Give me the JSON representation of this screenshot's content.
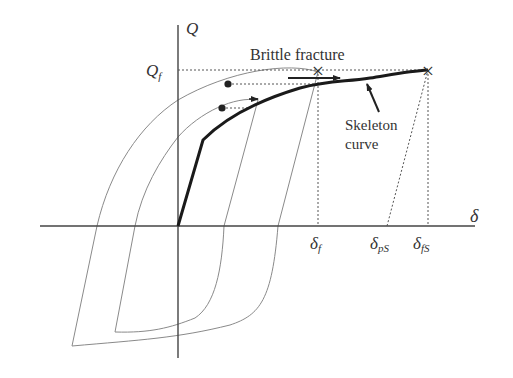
{
  "diagram": {
    "axes": {
      "y_label": "Q",
      "x_label": "δ"
    },
    "labels": {
      "q_f": "Q",
      "q_f_sub": "f",
      "brittle_fracture": "Brittle fracture",
      "skeleton_line1": "Skeleton",
      "skeleton_line2": "curve",
      "delta_f": "δ",
      "delta_f_sub": "f",
      "delta_ps": "δ",
      "delta_ps_sub": "pS",
      "delta_fs": "δ",
      "delta_fs_sub": "fS"
    },
    "markers": {
      "fracture_point_1": "×",
      "fracture_point_2": "×"
    },
    "colors": {
      "background": "#ffffff",
      "axis": "#444444",
      "skeleton": "#1a1a1a",
      "loop": "#8a8a8a",
      "dashed": "#555555",
      "text": "#333333"
    }
  }
}
